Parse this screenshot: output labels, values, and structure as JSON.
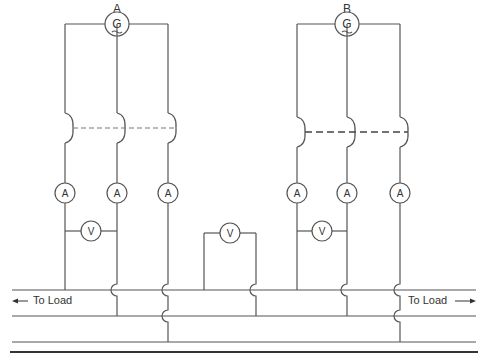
{
  "diagram": {
    "type": "parallel generator connection schematic",
    "generators": [
      {
        "label": "A",
        "symbol": "G",
        "cx": 117,
        "cy": 24,
        "legs": [
          65,
          117,
          168
        ],
        "switch_y": 128,
        "ammeter_y": 193,
        "voltmeter_y": 231,
        "voltmeter_between": [
          0,
          1
        ]
      },
      {
        "label": "B",
        "symbol": "G",
        "cx": 347,
        "cy": 24,
        "legs": [
          297,
          347,
          400
        ],
        "switch_y": 132,
        "ammeter_y": 193,
        "voltmeter_y": 231,
        "voltmeter_between": [
          0,
          1
        ]
      }
    ],
    "meters": {
      "ammeter_symbol": "A",
      "voltmeter_symbol": "V"
    },
    "middle_voltmeter": {
      "symbol": "V",
      "cx": 230,
      "cy": 233,
      "left_x": 204,
      "right_x": 256
    },
    "bus": {
      "lines_y": [
        290,
        316,
        342
      ],
      "thick_y": 352
    },
    "load_labels": {
      "left": "To Load",
      "right": "To Load"
    }
  }
}
